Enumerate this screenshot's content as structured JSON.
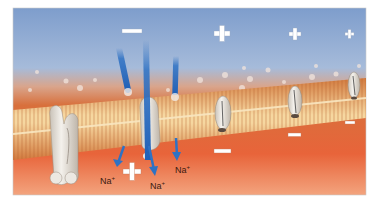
{
  "figure": {
    "colors": {
      "extracellular_top": "#7f9fcf",
      "extracellular_mid": "#a9bfdc",
      "membrane_outer": "#d9733a",
      "membrane_core": "#f3c583",
      "intracellular": "#e9643a",
      "intracellular_bottom": "#f6b28c",
      "arrow": "#2f72c4",
      "protein": "#e8e4de",
      "charge_symbol": "#ffffff"
    },
    "extracellular_charges": [
      {
        "id": "minus-top",
        "symbol": "−",
        "x": 131,
        "y": 31
      },
      {
        "id": "plus-1",
        "symbol": "+",
        "x": 222,
        "y": 33
      },
      {
        "id": "plus-2",
        "symbol": "+",
        "x": 295,
        "y": 34
      },
      {
        "id": "plus-3",
        "symbol": "+",
        "x": 349,
        "y": 34
      }
    ],
    "intracellular_charges": [
      {
        "id": "plus-inside",
        "symbol": "+",
        "x": 131,
        "y": 171
      },
      {
        "id": "minus-1",
        "symbol": "−",
        "x": 222,
        "y": 151
      },
      {
        "id": "minus-2",
        "symbol": "−",
        "x": 295,
        "y": 135
      },
      {
        "id": "minus-3",
        "symbol": "−",
        "x": 350,
        "y": 122
      }
    ],
    "ion_labels": [
      {
        "id": "na-1",
        "text": "Na",
        "charge": "+",
        "x": 100,
        "y": 180
      },
      {
        "id": "na-2",
        "text": "Na",
        "charge": "+",
        "x": 150,
        "y": 185
      },
      {
        "id": "na-3",
        "text": "Na",
        "charge": "+",
        "x": 175,
        "y": 169
      }
    ]
  }
}
